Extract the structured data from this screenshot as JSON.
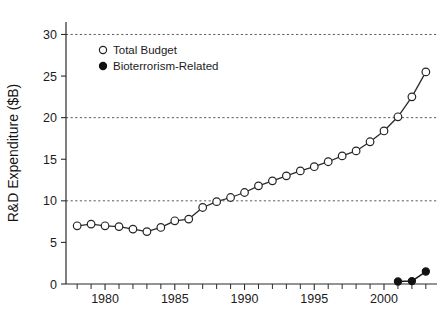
{
  "chart_data": {
    "type": "line",
    "title": "",
    "xlabel": "",
    "ylabel": "R&D Expenditure ($B)",
    "xlim": [
      1977.2,
      2003.8
    ],
    "ylim": [
      0,
      31.5
    ],
    "yticks": [
      0,
      5,
      10,
      15,
      20,
      25,
      30
    ],
    "ytick_labels": [
      "0",
      "5",
      "10",
      "15",
      "20",
      "25",
      "30"
    ],
    "xticks": [
      1978,
      1979,
      1980,
      1981,
      1982,
      1983,
      1984,
      1985,
      1986,
      1987,
      1988,
      1989,
      1990,
      1991,
      1992,
      1993,
      1994,
      1995,
      1996,
      1997,
      1998,
      1999,
      2000,
      2001,
      2002,
      2003
    ],
    "xtick_labels_shown": [
      "1980",
      "1985",
      "1990",
      "1995",
      "2000"
    ],
    "xtick_labels_values": [
      1980,
      1985,
      1990,
      1995,
      2000
    ],
    "gridlines_y": [
      10,
      20,
      30
    ],
    "grid": "horizontal-dashed",
    "legend_position": "top-left-inside",
    "series": [
      {
        "name": "Total Budget",
        "marker": "open-circle",
        "x": [
          1978,
          1979,
          1980,
          1981,
          1982,
          1983,
          1984,
          1985,
          1986,
          1987,
          1988,
          1989,
          1990,
          1991,
          1992,
          1993,
          1994,
          1995,
          1996,
          1997,
          1998,
          1999,
          2000,
          2001,
          2002,
          2003
        ],
        "values": [
          7.0,
          7.2,
          7.0,
          6.9,
          6.6,
          6.3,
          6.8,
          7.6,
          7.8,
          9.2,
          9.9,
          10.4,
          11.0,
          11.8,
          12.4,
          13.0,
          13.6,
          14.1,
          14.7,
          15.4,
          16.0,
          17.1,
          18.4,
          20.1,
          22.5,
          25.5
        ]
      },
      {
        "name": "Bioterrorism-Related",
        "marker": "filled-circle",
        "x": [
          2001,
          2002,
          2003
        ],
        "values": [
          0.3,
          0.35,
          1.5
        ]
      }
    ]
  },
  "legend": {
    "items": [
      {
        "label": "Total Budget",
        "marker": "open-circle",
        "color": "#ffffff"
      },
      {
        "label": "Bioterrorism-Related",
        "marker": "filled-circle",
        "color": "#111111"
      }
    ]
  },
  "axes": {
    "y_title": "R&D Expenditure ($B)",
    "y_labels": [
      "30",
      "25",
      "20",
      "15",
      "10",
      "5",
      "0"
    ],
    "x_labels": [
      "1980",
      "1985",
      "1990",
      "1995",
      "2000"
    ]
  },
  "colors": {
    "background": "#ffffff",
    "axis": "#2b2b2b",
    "grid": "#4a4a4a",
    "line": "#2a2a2a",
    "marker_open_fill": "#ffffff",
    "marker_filled_fill": "#111111",
    "text": "#1a1a1a"
  }
}
